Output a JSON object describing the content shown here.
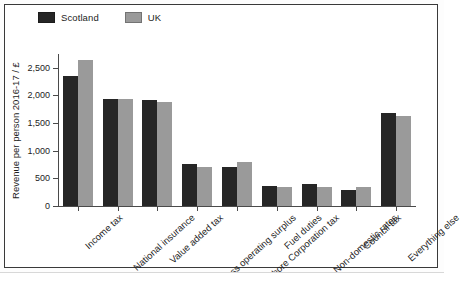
{
  "chart_data": {
    "type": "bar",
    "title": "",
    "subtitle": "",
    "xlabel": "",
    "ylabel": "Revenue per person 2016-17 / £",
    "ylim": [
      0,
      2750
    ],
    "yticks": [
      0,
      500,
      1000,
      1500,
      2000,
      2500
    ],
    "ytick_labels": [
      "0",
      "500",
      "1,000",
      "1,500",
      "2,000",
      "2,500"
    ],
    "grid": false,
    "legend_position": "top-left",
    "categories": [
      "Income tax",
      "National insurance",
      "Value added tax",
      "Gross operating surplus",
      "Onshore Corporation tax",
      "Fuel duties",
      "Non-domestic rates",
      "Council tax",
      "Everything else"
    ],
    "series": [
      {
        "name": "Scotland",
        "color": "#262626",
        "values": [
          2350,
          1930,
          1910,
          760,
          700,
          370,
          390,
          290,
          1680
        ]
      },
      {
        "name": "UK",
        "color": "#9a9a9a",
        "values": [
          2650,
          1930,
          1880,
          700,
          800,
          340,
          350,
          340,
          1630
        ]
      }
    ]
  },
  "legend": {
    "items": [
      {
        "label": "Scotland",
        "swatch": "#262626"
      },
      {
        "label": "UK",
        "swatch": "#9a9a9a"
      }
    ]
  }
}
